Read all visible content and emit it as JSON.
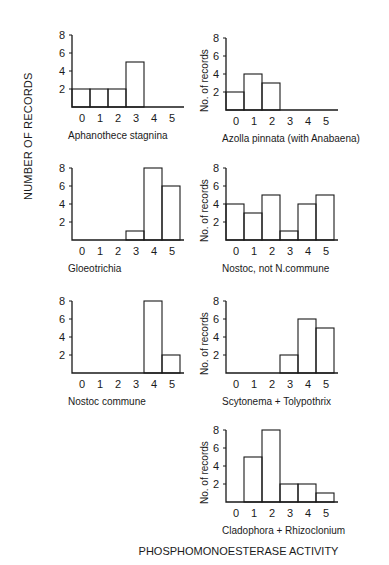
{
  "figure": {
    "ylabel": "NUMBER OF RECORDS",
    "xlabel": "PHOSPHOMONOESTERASE ACTIVITY",
    "panel_ylabel": "No. of records"
  },
  "chart_data": [
    {
      "type": "bar",
      "title": "Aphanothece stagnina",
      "categories": [
        "0",
        "1",
        "2",
        "3",
        "4",
        "5"
      ],
      "values": [
        2,
        2,
        2,
        5,
        0,
        0
      ],
      "yticks": [
        2,
        4,
        6,
        8
      ],
      "ylim": [
        0,
        8
      ],
      "ylabel": ""
    },
    {
      "type": "bar",
      "title": "Azolla pinnata (with Anabaena)",
      "categories": [
        "0",
        "1",
        "2",
        "3",
        "4",
        "5"
      ],
      "values": [
        2,
        4,
        3,
        0,
        0,
        0
      ],
      "yticks": [
        2,
        4,
        6,
        8
      ],
      "ylim": [
        0,
        8
      ],
      "ylabel": "No. of records"
    },
    {
      "type": "bar",
      "title": "Gloeotrichia",
      "categories": [
        "0",
        "1",
        "2",
        "3",
        "4",
        "5"
      ],
      "values": [
        0,
        0,
        0,
        1,
        8,
        6
      ],
      "yticks": [
        2,
        4,
        6,
        8
      ],
      "ylim": [
        0,
        8
      ],
      "ylabel": ""
    },
    {
      "type": "bar",
      "title": "Nostoc, not N.commune",
      "categories": [
        "0",
        "1",
        "2",
        "3",
        "4",
        "5"
      ],
      "values": [
        4,
        3,
        5,
        1,
        4,
        5
      ],
      "yticks": [
        2,
        4,
        6,
        8
      ],
      "ylim": [
        0,
        8
      ],
      "ylabel": "No. of records"
    },
    {
      "type": "bar",
      "title": "Nostoc commune",
      "categories": [
        "0",
        "1",
        "2",
        "3",
        "4",
        "5"
      ],
      "values": [
        0,
        0,
        0,
        0,
        8,
        2
      ],
      "yticks": [
        2,
        4,
        6,
        8
      ],
      "ylim": [
        0,
        8
      ],
      "ylabel": ""
    },
    {
      "type": "bar",
      "title": "Scytonema + Tolypothrix",
      "categories": [
        "0",
        "1",
        "2",
        "3",
        "4",
        "5"
      ],
      "values": [
        0,
        0,
        0,
        2,
        6,
        5
      ],
      "yticks": [
        2,
        4,
        6,
        8
      ],
      "ylim": [
        0,
        8
      ],
      "ylabel": "No. of records"
    },
    {
      "type": "bar",
      "title": "Cladophora + Rhizoclonium",
      "categories": [
        "0",
        "1",
        "2",
        "3",
        "4",
        "5"
      ],
      "values": [
        0,
        5,
        8,
        2,
        2,
        1
      ],
      "yticks": [
        2,
        4,
        6,
        8
      ],
      "ylim": [
        0,
        8
      ],
      "ylabel": "No. of records"
    }
  ],
  "layout": [
    {
      "x": 72,
      "y": 35,
      "has_ylabel": false
    },
    {
      "x": 226,
      "y": 38,
      "has_ylabel": true
    },
    {
      "x": 72,
      "y": 168,
      "has_ylabel": false
    },
    {
      "x": 226,
      "y": 168,
      "has_ylabel": true
    },
    {
      "x": 72,
      "y": 301,
      "has_ylabel": false
    },
    {
      "x": 226,
      "y": 301,
      "has_ylabel": true
    },
    {
      "x": 226,
      "y": 430,
      "has_ylabel": true
    }
  ]
}
